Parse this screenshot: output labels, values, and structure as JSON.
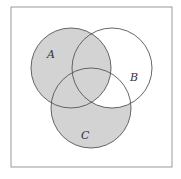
{
  "diagram": {
    "type": "venn-3-set",
    "frame": {
      "x": 11,
      "y": 7,
      "width": 161,
      "height": 160,
      "stroke": "#9a9a9a"
    },
    "colors": {
      "shade": "#d3d3d3",
      "outline": "#555555",
      "background": "#ffffff"
    },
    "sets": [
      {
        "label": "A",
        "cx": 71,
        "cy": 68,
        "r": 40,
        "label_x": 47,
        "label_y": 58
      },
      {
        "label": "B",
        "cx": 112,
        "cy": 68,
        "r": 40,
        "label_x": 130,
        "label_y": 81
      },
      {
        "label": "C",
        "cx": 91,
        "cy": 108,
        "r": 40,
        "label_x": 81,
        "label_y": 139
      }
    ],
    "shaded_regions": [
      "A only",
      "A∩B only",
      "A∩C only",
      "A∩B∩C",
      "C only"
    ],
    "unshaded_regions": [
      "B only",
      "B∩C only",
      "outside"
    ]
  }
}
